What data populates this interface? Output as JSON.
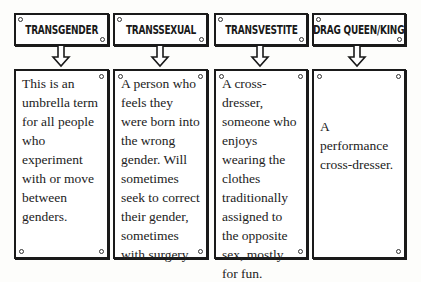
{
  "terms": [
    {
      "title": "TRANSGENDER",
      "definition": "This is an umbrella term for all people who experiment with or move between genders."
    },
    {
      "title": "TRANSSEXUAL",
      "definition": "A person who feels they were born into the wrong gender. Will sometimes seek to correct their gender, sometimes with surgery."
    },
    {
      "title": "TRANSVESTITE",
      "definition": "A cross-dresser, someone who enjoys wearing the clothes traditionally assigned to the opposite sex, mostly for fun."
    },
    {
      "title": "DRAG QUEEN/KING",
      "definition": "A performance cross-dresser."
    }
  ],
  "colors": {
    "ink": "#1a1a1a",
    "paper": "#fdfdfb"
  }
}
